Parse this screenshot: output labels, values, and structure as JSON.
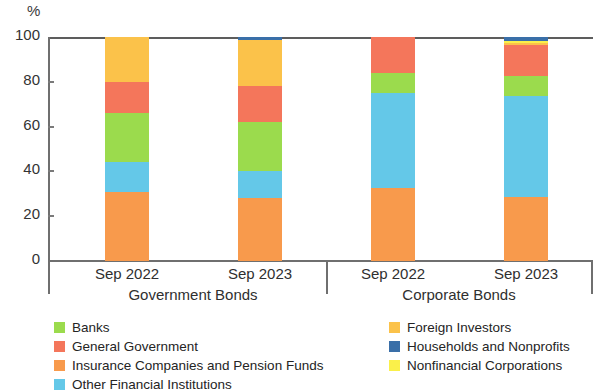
{
  "chart_data": {
    "type": "bar",
    "subtype": "stacked-percentage",
    "title": "",
    "subtitle": "",
    "xlabel": "",
    "ylabel": "%",
    "ylim": [
      0,
      100
    ],
    "yticks": [
      0,
      20,
      40,
      60,
      80,
      100
    ],
    "ytick_labels": [
      "0",
      "20",
      "40",
      "60",
      "80",
      "100"
    ],
    "grid": false,
    "legend_position": "bottom",
    "groups": [
      {
        "name": "Government Bonds",
        "categories": [
          "Sep 2022",
          "Sep 2023"
        ]
      },
      {
        "name": "Corporate Bonds",
        "categories": [
          "Sep 2022",
          "Sep 2023"
        ]
      }
    ],
    "categories": [
      "Sep 2022",
      "Sep 2023",
      "Sep 2022",
      "Sep 2023"
    ],
    "series": [
      {
        "name": "Insurance Companies and Pension Funds",
        "color": "#F89A4C",
        "values": [
          31,
          28,
          32.5,
          28.5
        ]
      },
      {
        "name": "Other Financial Institutions",
        "color": "#64C8E8",
        "values": [
          13,
          12,
          42.5,
          45
        ]
      },
      {
        "name": "Banks",
        "color": "#9BDB4D",
        "values": [
          22,
          22,
          9,
          9
        ]
      },
      {
        "name": "General Government",
        "color": "#F4765B",
        "values": [
          14,
          16,
          16,
          14
        ]
      },
      {
        "name": "Foreign Investors",
        "color": "#FBC24A",
        "values": [
          20,
          20.5,
          0,
          1
        ]
      },
      {
        "name": "Nonfinancial Corporations",
        "color": "#FAF04A",
        "values": [
          0,
          0,
          0,
          0.8
        ]
      },
      {
        "name": "Households and Nonprofits",
        "color": "#3A6FA8",
        "values": [
          0,
          1.5,
          0,
          1.7
        ]
      }
    ],
    "legend_left": [
      {
        "label": "Banks",
        "color": "#9BDB4D"
      },
      {
        "label": "General Government",
        "color": "#F4765B"
      },
      {
        "label": "Insurance Companies and Pension Funds",
        "color": "#F89A4C"
      },
      {
        "label": "Other Financial Institutions",
        "color": "#64C8E8"
      }
    ],
    "legend_right": [
      {
        "label": "Foreign Investors",
        "color": "#FBC24A"
      },
      {
        "label": "Households and Nonprofits",
        "color": "#3A6FA8"
      },
      {
        "label": "Nonfinancial Corporations",
        "color": "#FAF04A"
      }
    ]
  },
  "axis": {
    "y_unit_label": "%"
  }
}
